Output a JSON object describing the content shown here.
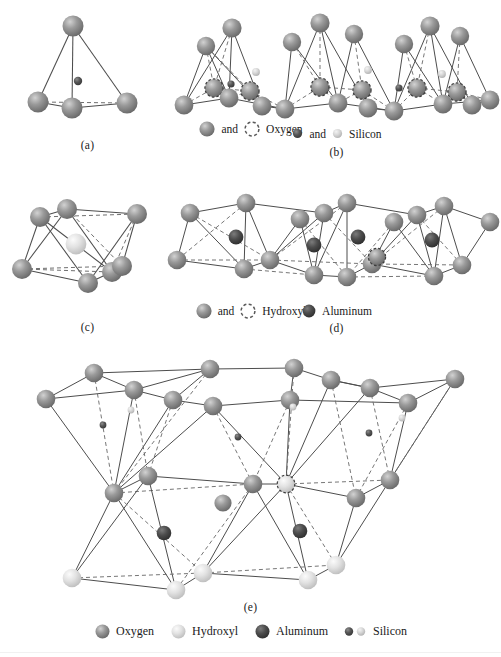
{
  "figure": {
    "type": "crystal-structure-diagram",
    "background": "#ffffff"
  },
  "colors": {
    "oxygen": "#8c8c8c",
    "oxygen_dark": "#6e6e6e",
    "oxygen_light": "#b3b3b3",
    "hydroxyl": "#d9d9d9",
    "hydroxyl_light": "#efefef",
    "aluminum": "#4a4a4a",
    "aluminum_light": "#6b6b6b",
    "silicon_dark": "#4f4f4f",
    "silicon_light": "#d2d2d2",
    "bond_solid": "#4d4d4d",
    "bond_dashed": "#6f6f6f",
    "text": "#1a1a1a"
  },
  "panels": [
    {
      "id": "a",
      "caption": "(a)",
      "title": "silica-tetrahedron",
      "legend": {
        "prefix_sphere": "oxygen",
        "conjunction": "and",
        "dashed_circle": true,
        "label": "Oxygen"
      }
    },
    {
      "id": "b",
      "caption": "(b)",
      "title": "silica-sheet",
      "legend": {
        "prefix_sphere": "silicon-dark",
        "conjunction": "and",
        "second_sphere": "silicon-light",
        "label": "Silicon"
      }
    },
    {
      "id": "c",
      "caption": "(c)",
      "title": "alumina-octahedron",
      "legend": {
        "prefix_sphere": "hydroxyl-gray",
        "conjunction": "and",
        "dashed_circle": true,
        "label": "Hydroxyl"
      }
    },
    {
      "id": "d",
      "caption": "(d)",
      "title": "octahedral-sheet",
      "legend": {
        "prefix_sphere": "aluminum",
        "label": "Aluminum"
      }
    },
    {
      "id": "e",
      "caption": "(e)",
      "title": "combined-silica-gibbsite-sheet"
    }
  ],
  "bottom_legend": {
    "items": [
      {
        "sphere": "oxygen",
        "label": "Oxygen"
      },
      {
        "sphere": "hydroxyl",
        "label": "Hydroxyl"
      },
      {
        "sphere": "aluminum",
        "label": "Aluminum"
      },
      {
        "sphere": "silicon",
        "label": "Silicon"
      }
    ]
  }
}
